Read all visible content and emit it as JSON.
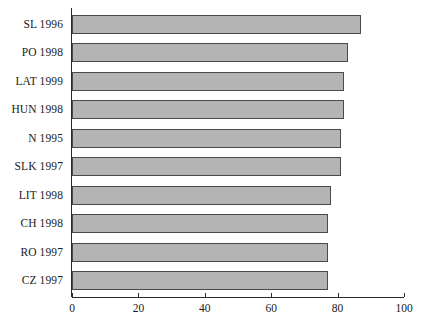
{
  "chart_data": {
    "type": "bar",
    "orientation": "horizontal",
    "title": "",
    "xlabel": "",
    "ylabel": "",
    "categories": [
      "SL 1996",
      "PO 1998",
      "LAT 1999",
      "HUN 1998",
      "N 1995",
      "SLK 1997",
      "LIT 1998",
      "CH 1998",
      "RO 1997",
      "CZ 1997"
    ],
    "values": [
      87,
      83,
      82,
      82,
      81,
      81,
      78,
      77,
      77,
      77
    ],
    "xlim": [
      0,
      100
    ],
    "xticks": [
      0,
      20,
      40,
      60,
      80,
      100
    ],
    "xticklabels": [
      "0",
      "20",
      "40",
      "60",
      "80",
      "100"
    ],
    "grid": false,
    "legend": false,
    "bar_color": "#b4b4b4",
    "bar_edge_color": "#4a4a4a",
    "axis_color": "#2b2b2b"
  },
  "caption": {
    "clipped_text": ""
  }
}
